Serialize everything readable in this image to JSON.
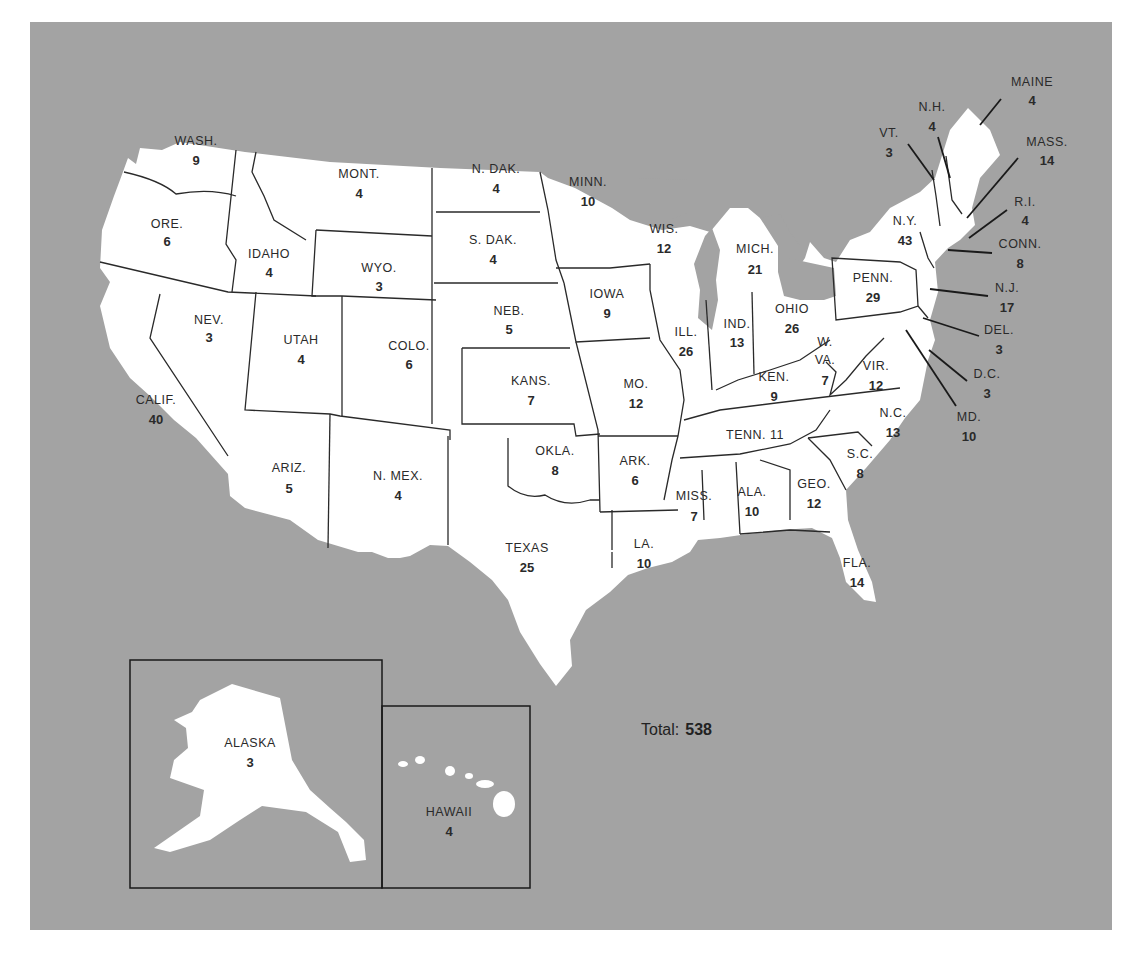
{
  "colors": {
    "background": "#a3a3a3",
    "land": "#ffffff",
    "border": "#2a2a2a"
  },
  "total": {
    "label": "Total:",
    "value": "538"
  },
  "chart_data": {
    "type": "map",
    "total": 538,
    "states": [
      {
        "label": "WASH.",
        "votes": 9,
        "x": 196,
        "y": 145,
        "ny": 165
      },
      {
        "label": "ORE.",
        "votes": 6,
        "x": 167,
        "y": 228,
        "ny": 246
      },
      {
        "label": "CALIF.",
        "votes": 40,
        "x": 156,
        "y": 404,
        "ny": 424
      },
      {
        "label": "IDAHO",
        "votes": 4,
        "x": 269,
        "y": 258,
        "ny": 277
      },
      {
        "label": "NEV.",
        "votes": 3,
        "x": 209,
        "y": 324,
        "ny": 342
      },
      {
        "label": "MONT.",
        "votes": 4,
        "x": 359,
        "y": 178,
        "ny": 198
      },
      {
        "label": "WYO.",
        "votes": 3,
        "x": 379,
        "y": 272,
        "ny": 291
      },
      {
        "label": "UTAH",
        "votes": 4,
        "x": 301,
        "y": 344,
        "ny": 364
      },
      {
        "label": "COLO.",
        "votes": 6,
        "x": 409,
        "y": 350,
        "ny": 369
      },
      {
        "label": "ARIZ.",
        "votes": 5,
        "x": 289,
        "y": 472,
        "ny": 493
      },
      {
        "label": "N. MEX.",
        "votes": 4,
        "x": 398,
        "y": 480,
        "ny": 500
      },
      {
        "label": "N. DAK.",
        "votes": 4,
        "x": 496,
        "y": 173,
        "ny": 193
      },
      {
        "label": "S. DAK.",
        "votes": 4,
        "x": 493,
        "y": 244,
        "ny": 264
      },
      {
        "label": "NEB.",
        "votes": 5,
        "x": 509,
        "y": 315,
        "ny": 334
      },
      {
        "label": "KANS.",
        "votes": 7,
        "x": 531,
        "y": 385,
        "ny": 405
      },
      {
        "label": "OKLA.",
        "votes": 8,
        "x": 555,
        "y": 455,
        "ny": 475
      },
      {
        "label": "TEXAS",
        "votes": 25,
        "x": 527,
        "y": 552,
        "ny": 572
      },
      {
        "label": "MINN.",
        "votes": 10,
        "x": 588,
        "y": 186,
        "ny": 206
      },
      {
        "label": "IOWA",
        "votes": 9,
        "x": 607,
        "y": 298,
        "ny": 318
      },
      {
        "label": "MO.",
        "votes": 12,
        "x": 636,
        "y": 388,
        "ny": 408
      },
      {
        "label": "ARK.",
        "votes": 6,
        "x": 635,
        "y": 465,
        "ny": 485
      },
      {
        "label": "LA.",
        "votes": 10,
        "x": 644,
        "y": 548,
        "ny": 568
      },
      {
        "label": "WIS.",
        "votes": 12,
        "x": 664,
        "y": 233,
        "ny": 253
      },
      {
        "label": "ILL.",
        "votes": 26,
        "x": 686,
        "y": 336,
        "ny": 356
      },
      {
        "label": "MICH.",
        "votes": 21,
        "x": 755,
        "y": 253,
        "ny": 274
      },
      {
        "label": "IND.",
        "votes": 13,
        "x": 737,
        "y": 328,
        "ny": 347
      },
      {
        "label": "OHIO",
        "votes": 26,
        "x": 792,
        "y": 313,
        "ny": 333
      },
      {
        "label": "KEN.",
        "votes": 9,
        "x": 774,
        "y": 381,
        "ny": 401
      },
      {
        "label": "TENN. 11",
        "votes": 11,
        "x": 755,
        "y": 439,
        "ny": null
      },
      {
        "label": "MISS.",
        "votes": 7,
        "x": 694,
        "y": 500,
        "ny": 521
      },
      {
        "label": "ALA.",
        "votes": 10,
        "x": 752,
        "y": 496,
        "ny": 516
      },
      {
        "label": "GEO.",
        "votes": 12,
        "x": 814,
        "y": 488,
        "ny": 508
      },
      {
        "label": "FLA.",
        "votes": 14,
        "x": 857,
        "y": 567,
        "ny": 587
      },
      {
        "label": "S.C.",
        "votes": 8,
        "x": 860,
        "y": 458,
        "ny": 478
      },
      {
        "label": "N.C.",
        "votes": 13,
        "x": 893,
        "y": 417,
        "ny": 437
      },
      {
        "label": "VIR.",
        "votes": 12,
        "x": 876,
        "y": 370,
        "ny": 390
      },
      {
        "label": "W. VA.",
        "votes": 7,
        "x": 825,
        "y": 346,
        "ny": 385
      },
      {
        "label": "PENN.",
        "votes": 29,
        "x": 873,
        "y": 282,
        "ny": 302
      },
      {
        "label": "N.Y.",
        "votes": 43,
        "x": 905,
        "y": 225,
        "ny": 245
      },
      {
        "label": "VT.",
        "votes": 3,
        "x": 889,
        "y": 137,
        "ny": 157
      },
      {
        "label": "N.H.",
        "votes": 4,
        "x": 932,
        "y": 111,
        "ny": 131
      },
      {
        "label": "MAINE",
        "votes": 4,
        "x": 1032,
        "y": 86,
        "ny": 105
      },
      {
        "label": "MASS.",
        "votes": 14,
        "x": 1047,
        "y": 146,
        "ny": 165
      },
      {
        "label": "R.I.",
        "votes": 4,
        "x": 1025,
        "y": 206,
        "ny": 225
      },
      {
        "label": "CONN.",
        "votes": 8,
        "x": 1020,
        "y": 248,
        "ny": 268
      },
      {
        "label": "N.J.",
        "votes": 17,
        "x": 1007,
        "y": 292,
        "ny": 312
      },
      {
        "label": "DEL.",
        "votes": 3,
        "x": 999,
        "y": 334,
        "ny": 354
      },
      {
        "label": "D.C.",
        "votes": 3,
        "x": 987,
        "y": 378,
        "ny": 398
      },
      {
        "label": "MD.",
        "votes": 10,
        "x": 969,
        "y": 421,
        "ny": 441
      },
      {
        "label": "ALASKA",
        "votes": 3,
        "x": 250,
        "y": 747,
        "ny": 767
      },
      {
        "label": "HAWAII",
        "votes": 4,
        "x": 449,
        "y": 816,
        "ny": 836
      }
    ]
  }
}
